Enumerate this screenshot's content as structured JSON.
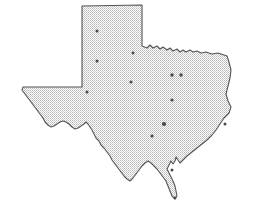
{
  "figure": {
    "type": "map",
    "width": 259,
    "height": 217,
    "background_color": "#ffffff"
  },
  "state": {
    "name": "Texas",
    "fill_color": "#d9d9d9",
    "fill_pattern": "halftone-dither-gray",
    "border_color": "#555555",
    "border_width": 1.1
  },
  "markers": {
    "color": "#4a4a4a",
    "shape": "dot",
    "default_radius": 1.5,
    "points": [
      {
        "name": "amarillo",
        "x": 97,
        "y": 31,
        "r": 1.5
      },
      {
        "name": "lubbock",
        "x": 97,
        "y": 61,
        "r": 1.5
      },
      {
        "name": "wichita-falls",
        "x": 133,
        "y": 53,
        "r": 1.4
      },
      {
        "name": "fort-worth",
        "x": 172,
        "y": 75,
        "r": 1.7
      },
      {
        "name": "dallas",
        "x": 181,
        "y": 75,
        "r": 1.7
      },
      {
        "name": "abilene",
        "x": 131,
        "y": 82,
        "r": 1.5
      },
      {
        "name": "midland-odessa",
        "x": 87,
        "y": 92,
        "r": 1.5
      },
      {
        "name": "waco",
        "x": 172,
        "y": 100,
        "r": 1.6
      },
      {
        "name": "houston",
        "x": 164,
        "y": 124,
        "r": 2.1
      },
      {
        "name": "east-texas",
        "x": 225,
        "y": 124,
        "r": 1.5
      },
      {
        "name": "austin-san-antonio",
        "x": 152,
        "y": 136,
        "r": 1.6
      },
      {
        "name": "corpus-christi",
        "x": 172,
        "y": 170,
        "r": 1.5
      },
      {
        "name": "brownsville",
        "x": 175,
        "y": 198,
        "r": 1.4
      }
    ]
  },
  "geometry": {
    "outline_path": "M 82,6 L 142,5 L 142,46 L 147,48 L 150,45 L 153,48 L 157,46 L 160,49 L 163,47 L 167,50 L 170,48 L 173,51 L 177,49 L 180,52 L 183,50 L 186,52 L 190,50 L 193,52 L 197,51 L 201,53 L 206,52 L 212,54 L 218,53 L 224,55 L 227,56 L 229,62 L 231,70 L 230,78 L 228,86 L 226,94 L 228,101 L 231,107 L 229,113 L 224,118 L 220,124 L 216,130 L 212,135 L 207,140 L 202,144 L 197,148 L 192,152 L 187,156 L 183,160 L 180,163 L 178,160 L 176,157 L 175,161 L 173,164 L 171,161 L 169,165 L 167,169 L 169,173 L 171,177 L 173,181 L 175,186 L 176,191 L 177,196 L 175,199 L 172,196 L 170,191 L 168,186 L 166,181 L 163,177 L 160,173 L 157,169 L 154,166 L 151,163 L 148,161 L 145,163 L 142,166 L 139,170 L 136,174 L 133,178 L 130,181 L 127,179 L 124,176 L 121,172 L 118,168 L 115,164 L 112,160 L 110,156 L 107,152 L 104,148 L 101,145 L 99,141 L 96,138 L 94,134 L 92,130 L 90,127 L 88,124 L 86,122 L 84,124 L 81,126 L 78,128 L 75,129 L 72,127 L 69,124 L 66,122 L 63,121 L 60,122 L 57,124 L 54,126 L 51,127 L 48,125 L 45,122 L 43,118 L 40,114 L 37,110 L 34,106 L 31,102 L 28,98 L 25,94 L 22,90 L 23,87 L 27,87 L 34,87 L 42,87 L 50,87 L 58,87 L 66,87 L 74,87 L 82,87 Z"
  }
}
